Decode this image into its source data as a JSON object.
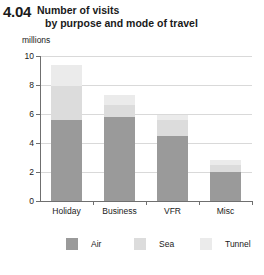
{
  "figure_number": "4.04",
  "title_lines": [
    "Number of visits",
    "by purpose and mode of travel"
  ],
  "units_label": "millions",
  "colors": {
    "air": "#9a9a9a",
    "sea": "#dcdcdc",
    "tunnel": "#ebebeb",
    "axis": "#6f6f6f",
    "grid": "#d9d9d9"
  },
  "legend": {
    "items": [
      {
        "label": "Air",
        "color_key": "air"
      },
      {
        "label": "Sea",
        "color_key": "sea"
      },
      {
        "label": "Tunnel",
        "color_key": "tunnel"
      }
    ]
  },
  "chart_data": {
    "type": "bar",
    "stacked": true,
    "title": "Number of visits by purpose and mode of travel",
    "xlabel": "",
    "ylabel": "millions",
    "ylim": [
      0,
      10
    ],
    "yticks": [
      0,
      2,
      4,
      6,
      8,
      10
    ],
    "ytick_labels": [
      "0",
      "2",
      "4",
      "6",
      "8",
      "10"
    ],
    "grid": true,
    "legend_position": "bottom",
    "categories": [
      "Holiday",
      "Business",
      "VFR",
      "Misc"
    ],
    "series": [
      {
        "name": "Air",
        "values": [
          5.6,
          5.8,
          4.5,
          2.0
        ]
      },
      {
        "name": "Sea",
        "values": [
          2.3,
          0.8,
          1.1,
          0.5
        ]
      },
      {
        "name": "Tunnel",
        "values": [
          1.45,
          0.7,
          0.3,
          0.35
        ]
      }
    ],
    "totals": [
      9.35,
      7.3,
      5.9,
      2.85
    ]
  }
}
